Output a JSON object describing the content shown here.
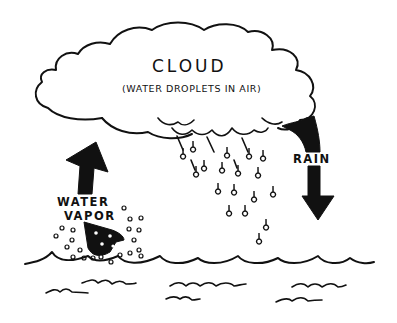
{
  "diagram": {
    "type": "water-cycle",
    "colors": {
      "ink": "#111111",
      "background": "#ffffff"
    },
    "cloud": {
      "title": "CLOUD",
      "subtitle": "(WATER DROPLETS IN AIR)"
    },
    "evaporation": {
      "label_line1": "WATER",
      "label_line2": "VAPOR",
      "arrow_direction": "up"
    },
    "precipitation": {
      "label": "RAIN",
      "arrow_direction": "down"
    },
    "water_body": {
      "label": ""
    }
  }
}
